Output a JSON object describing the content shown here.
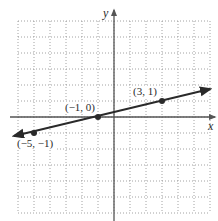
{
  "graph": {
    "x_axis_label": "x",
    "y_axis_label": "y",
    "x_range": [
      -6,
      6
    ],
    "y_range": [
      -6,
      6
    ],
    "grid": "dotted, unit spacing",
    "line": {
      "description": "line through the three labeled points, arrows at both ends",
      "slope": 0.25,
      "y_intercept": 0.25
    },
    "points": [
      {
        "label": "(−5, −1)",
        "x": -5,
        "y": -1
      },
      {
        "label": "(−1, 0)",
        "x": -1,
        "y": 0
      },
      {
        "label": "(3, 1)",
        "x": 3,
        "y": 1
      }
    ]
  },
  "colors": {
    "line": "#2a2a2a",
    "grid": "#8a8a8a",
    "axis": "#555555"
  }
}
